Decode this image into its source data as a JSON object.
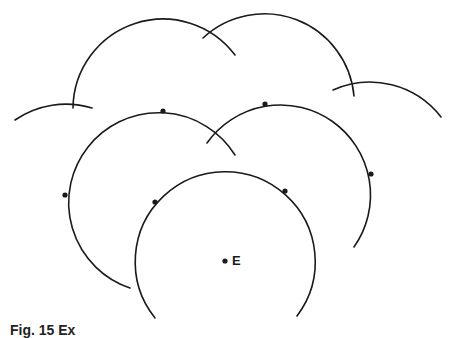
{
  "figure": {
    "stroke_color": "#1a1a1a",
    "radius": 90,
    "center_point": {
      "label": "E",
      "x": 225,
      "y": 261
    },
    "marked_points": [
      {
        "x": 155,
        "y": 202
      },
      {
        "x": 285,
        "y": 191
      },
      {
        "x": 65,
        "y": 195
      },
      {
        "x": 163,
        "y": 111
      },
      {
        "x": 265,
        "y": 104
      },
      {
        "x": 371,
        "y": 174
      }
    ],
    "arcs": [
      {
        "name": "arc-bottom-circle-E",
        "cx": 225,
        "cy": 261,
        "from": [
          155,
          318
        ],
        "to": [
          297,
          316
        ],
        "large": 1
      },
      {
        "name": "arc-left-middle",
        "cx": 155,
        "cy": 202,
        "from": [
          130,
          288
        ],
        "to": [
          235,
          155
        ],
        "large": 1
      },
      {
        "name": "arc-right-middle",
        "cx": 285,
        "cy": 191,
        "from": [
          207,
          143
        ],
        "to": [
          354,
          247
        ],
        "large": 0
      },
      {
        "name": "arc-upper-left",
        "cx": 163,
        "cy": 111,
        "from": [
          73,
          108
        ],
        "to": [
          235,
          55
        ],
        "large": 0
      },
      {
        "name": "arc-upper-right",
        "cx": 265,
        "cy": 104,
        "from": [
          203,
          38
        ],
        "to": [
          354,
          96
        ],
        "large": 0
      },
      {
        "name": "arc-far-left-small",
        "cx": 65,
        "cy": 195,
        "from": [
          15,
          120
        ],
        "to": [
          92,
          108
        ],
        "large": 0
      },
      {
        "name": "arc-far-right-small",
        "cx": 371,
        "cy": 174,
        "from": [
          333,
          90
        ],
        "to": [
          441,
          117
        ],
        "large": 0
      }
    ]
  },
  "caption": "Fig. 15 Ex"
}
